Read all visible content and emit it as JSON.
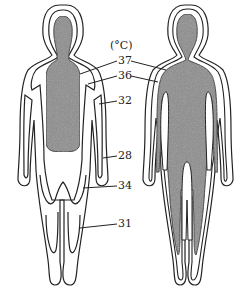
{
  "diagram": {
    "unit_label": "(°C)",
    "figures": [
      {
        "id": "left",
        "description": "body in cold environment – warm core confined to trunk and head"
      },
      {
        "id": "right",
        "description": "body in warm environment – warm core extends into limbs"
      }
    ],
    "isotherm_labels": [
      {
        "value": "37",
        "x": 118,
        "y": 58
      },
      {
        "value": "36",
        "x": 118,
        "y": 73
      },
      {
        "value": "32",
        "x": 118,
        "y": 97
      },
      {
        "value": "28",
        "x": 118,
        "y": 152
      },
      {
        "value": "34",
        "x": 118,
        "y": 182
      },
      {
        "value": "31",
        "x": 118,
        "y": 220
      }
    ],
    "colors": {
      "core_fill": "#8a8a8a",
      "line": "#222222",
      "background": "#ffffff"
    }
  }
}
